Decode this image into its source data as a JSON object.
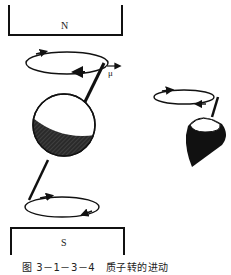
{
  "diagram": {
    "north_pole_label": "N",
    "south_pole_label": "S",
    "magnetic_moment_label": "μ",
    "caption": "图 3－1－3－4　质子转的进动",
    "colors": {
      "ink": "#111111",
      "background": "#ffffff"
    },
    "elements": [
      {
        "name": "north-magnet",
        "shape": "open-bottom bracket (U opening downward)"
      },
      {
        "name": "precession-orbit-top",
        "shape": "ellipse with arrows"
      },
      {
        "name": "spinning-nucleus",
        "shape": "sphere half-shaded with axis"
      },
      {
        "name": "precession-orbit-bottom",
        "shape": "ellipse with arrows"
      },
      {
        "name": "south-magnet",
        "shape": "open-top bracket"
      },
      {
        "name": "spinning-top-analogy",
        "shape": "spinning top with precession orbit"
      }
    ]
  }
}
